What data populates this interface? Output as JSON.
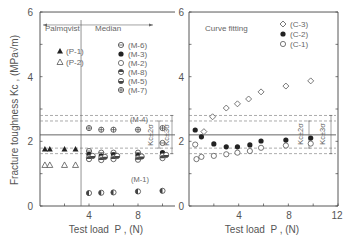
{
  "chart_data": [
    {
      "type": "scatter",
      "panel": "left",
      "title": "",
      "xlabel": "Test load  P , (N)",
      "ylabel": "Fracture toughness  Kc , (MPa√m)",
      "xlim": [
        0,
        11.2
      ],
      "ylim": [
        0,
        6
      ],
      "x_ticks": [
        4,
        8
      ],
      "y_ticks": [
        0,
        2,
        4,
        6
      ],
      "grid": false,
      "region_labels": [
        "Palmqvist",
        "Median"
      ],
      "region_divider_x": 3.35,
      "reference_lines": {
        "mean": 2.2,
        "upper_2sigma": 2.63,
        "upper_3sigma": 2.8,
        "lower_2sigma": 1.79,
        "lower_3sigma": 1.62,
        "labels": [
          "Kc±2σ",
          "Kc±3σ"
        ]
      },
      "annotations": [
        "(M-4)",
        "(M-1)"
      ],
      "series": [
        {
          "name": "(P-1)",
          "marker": "filled-triangle",
          "x": [
            0.4,
            0.8,
            2.0,
            2.9
          ],
          "y": [
            1.76,
            1.76,
            1.76,
            1.76
          ]
        },
        {
          "name": "(P-2)",
          "marker": "open-triangle",
          "x": [
            0.4,
            0.8,
            2.0,
            2.9
          ],
          "y": [
            1.27,
            1.27,
            1.27,
            1.27
          ]
        },
        {
          "name": "(M-6)",
          "marker": "circle-horizontal-line",
          "x": [
            4,
            5,
            6,
            8,
            10
          ],
          "y": [
            1.7,
            1.65,
            1.65,
            1.65,
            1.95
          ]
        },
        {
          "name": "(M-3)",
          "marker": "filled-circle",
          "x": [
            4,
            5,
            6,
            8,
            10
          ],
          "y": [
            1.6,
            1.55,
            1.58,
            1.57,
            1.65
          ]
        },
        {
          "name": "(M-2)",
          "marker": "open-circle",
          "x": [
            4,
            5,
            6,
            8,
            10
          ],
          "y": [
            1.5,
            1.48,
            1.5,
            1.48,
            1.55
          ]
        },
        {
          "name": "(M-8)",
          "marker": "circle-half",
          "x": [
            4,
            5,
            6,
            8,
            10
          ],
          "y": [
            1.45,
            1.42,
            1.45,
            1.43,
            1.48
          ]
        },
        {
          "name": "(M-5)",
          "marker": "circle-bottom-filled",
          "x": [
            4.3,
            5.3,
            6.3,
            8.3,
            10.3
          ],
          "y": [
            1.55,
            1.52,
            1.55,
            1.53,
            1.58
          ]
        },
        {
          "name": "(M-7)",
          "marker": "circle-cross",
          "x": [
            4,
            5,
            6,
            8,
            10
          ],
          "y": [
            2.41,
            2.36,
            2.36,
            2.36,
            2.41
          ]
        },
        {
          "name": "(M-1)",
          "marker": "circle-left-filled",
          "x": [
            4,
            5,
            6,
            8,
            10
          ],
          "y": [
            0.4,
            0.41,
            0.42,
            0.45,
            0.47
          ]
        }
      ]
    },
    {
      "type": "scatter",
      "panel": "right",
      "title": "Curve fitting",
      "xlabel": "Test load  P , (N)",
      "ylabel": "",
      "xlim": [
        0,
        12
      ],
      "ylim": [
        0,
        6
      ],
      "x_ticks": [
        4,
        8,
        12
      ],
      "y_ticks": [
        0,
        2,
        4,
        6
      ],
      "grid": false,
      "reference_lines": {
        "mean": 2.2,
        "upper_2sigma": 2.63,
        "upper_3sigma": 2.8,
        "lower_2sigma": 1.79,
        "lower_3sigma": 1.62,
        "labels": [
          "Kc±2σ",
          "Kc±3σ"
        ]
      },
      "series": [
        {
          "name": "(C-3)",
          "marker": "open-diamond",
          "x": [
            1.2,
            1.9,
            3.0,
            3.9,
            4.8,
            5.8,
            7.8,
            9.8
          ],
          "y": [
            2.3,
            2.76,
            3.03,
            3.16,
            3.31,
            3.53,
            3.71,
            3.87
          ]
        },
        {
          "name": "(C-2)",
          "marker": "filled-circle",
          "x": [
            0.5,
            1.0,
            2.0,
            3.0,
            3.9,
            4.9,
            5.8,
            7.8,
            9.8
          ],
          "y": [
            2.35,
            2.14,
            1.92,
            1.83,
            1.83,
            1.89,
            2.01,
            2.04,
            2.1
          ]
        },
        {
          "name": "(C-1)",
          "marker": "open-circle",
          "x": [
            0.5,
            0.6,
            1.0,
            2.0,
            3.0,
            3.9,
            4.9,
            5.8,
            7.8,
            9.8
          ],
          "y": [
            1.9,
            1.45,
            1.52,
            1.55,
            1.6,
            1.65,
            1.7,
            1.8,
            1.87,
            1.93
          ]
        }
      ]
    }
  ],
  "left_panel": {
    "region_palmqvist": "Palmqvist",
    "region_median": "Median",
    "legend": [
      "(M-6)",
      "(M-3)",
      "(M-2)",
      "(M-8)",
      "(M-5)",
      "(M-7)"
    ],
    "legend_p": [
      "(P-1)",
      "(P-2)"
    ],
    "ann_m4": "(M-4)",
    "ann_m1": "(M-1)",
    "ann_2s": "Kc±2σ",
    "ann_3s": "Kc±3σ",
    "y_ticks": [
      "0",
      "2",
      "4",
      "6"
    ],
    "x_ticks": [
      "4",
      "8"
    ],
    "xlabel": "Test load  P , (N)",
    "ylabel": "Fracture toughness  Kc , (MPa√m)"
  },
  "right_panel": {
    "title": "Curve fitting",
    "legend": [
      "(C-3)",
      "(C-2)",
      "(C-1)"
    ],
    "ann_2s": "Kc±2σ",
    "ann_3s": "Kc±3σ",
    "y_ticks": [
      "0",
      "2",
      "4",
      "6"
    ],
    "x_ticks": [
      "4",
      "8",
      "12"
    ],
    "xlabel": "Test load  P , (N)"
  }
}
